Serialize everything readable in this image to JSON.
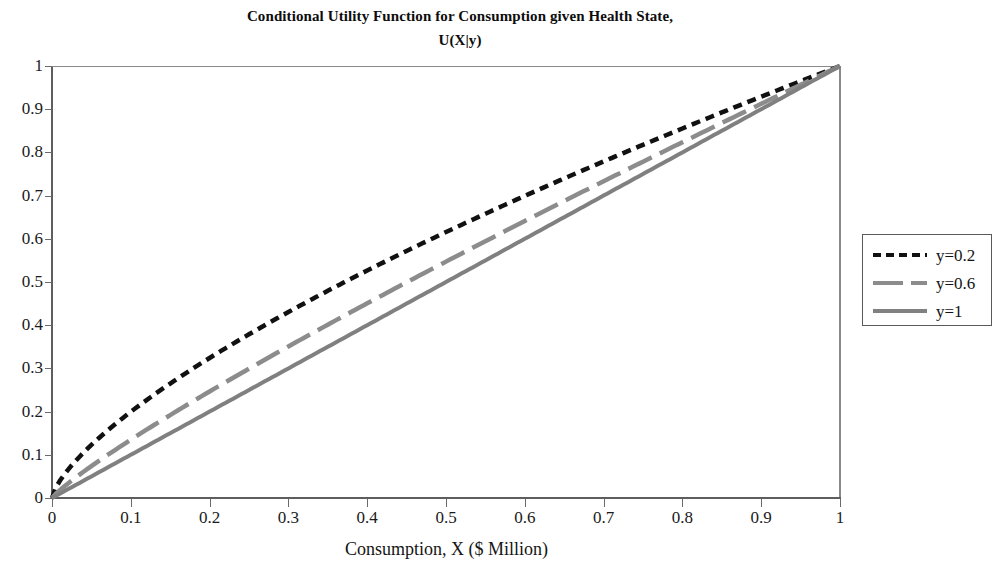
{
  "chart_data": {
    "type": "line",
    "title": "Conditional Utility Function for Consumption given Health State, U(X|y)",
    "title_line1": "Conditional Utility Function for Consumption given Health State,",
    "title_line2": "U(X|y)",
    "xlabel": "Consumption, X ($ Million)",
    "ylabel": "",
    "xlim": [
      0,
      1
    ],
    "ylim": [
      0,
      1
    ],
    "grid": false,
    "legend_position": "right",
    "xticks": [
      "0",
      "0.1",
      "0.2",
      "0.3",
      "0.4",
      "0.5",
      "0.6",
      "0.7",
      "0.8",
      "0.9",
      "1"
    ],
    "xtick_values": [
      0,
      0.1,
      0.2,
      0.3,
      0.4,
      0.5,
      0.6,
      0.7,
      0.8,
      0.9,
      1
    ],
    "yticks": [
      "0",
      "0.1",
      "0.2",
      "0.3",
      "0.4",
      "0.5",
      "0.6",
      "0.7",
      "0.8",
      "0.9",
      "1"
    ],
    "ytick_values": [
      0,
      0.1,
      0.2,
      0.3,
      0.4,
      0.5,
      0.6,
      0.7,
      0.8,
      0.9,
      1
    ],
    "x": [
      0,
      0.05,
      0.1,
      0.15,
      0.2,
      0.25,
      0.3,
      0.35,
      0.4,
      0.45,
      0.5,
      0.55,
      0.6,
      0.65,
      0.7,
      0.75,
      0.8,
      0.85,
      0.9,
      0.95,
      1
    ],
    "series": [
      {
        "name": "y=0.2",
        "color": "#111111",
        "style": "dotted",
        "exponent": 0.7,
        "values": [
          0,
          0.121,
          0.2,
          0.268,
          0.324,
          0.38,
          0.432,
          0.479,
          0.525,
          0.569,
          0.613,
          0.654,
          0.695,
          0.735,
          0.773,
          0.811,
          0.848,
          0.885,
          0.921,
          0.957,
          1
        ]
      },
      {
        "name": "y=0.6",
        "color": "#8c8c8c",
        "style": "dashed",
        "exponent": 0.87,
        "values": [
          0,
          0.072,
          0.132,
          0.188,
          0.24,
          0.289,
          0.337,
          0.383,
          0.428,
          0.472,
          0.515,
          0.558,
          0.6,
          0.641,
          0.682,
          0.722,
          0.762,
          0.802,
          0.841,
          0.88,
          1
        ]
      },
      {
        "name": "y=1",
        "color": "#808080",
        "style": "solid",
        "exponent": 1.0,
        "values": [
          0,
          0.05,
          0.1,
          0.15,
          0.2,
          0.25,
          0.3,
          0.35,
          0.4,
          0.45,
          0.5,
          0.55,
          0.6,
          0.65,
          0.7,
          0.75,
          0.8,
          0.85,
          0.9,
          0.95,
          1
        ]
      }
    ]
  },
  "legend": {
    "items": [
      {
        "label": "y=0.2"
      },
      {
        "label": "y=0.6"
      },
      {
        "label": "y=1"
      }
    ]
  }
}
